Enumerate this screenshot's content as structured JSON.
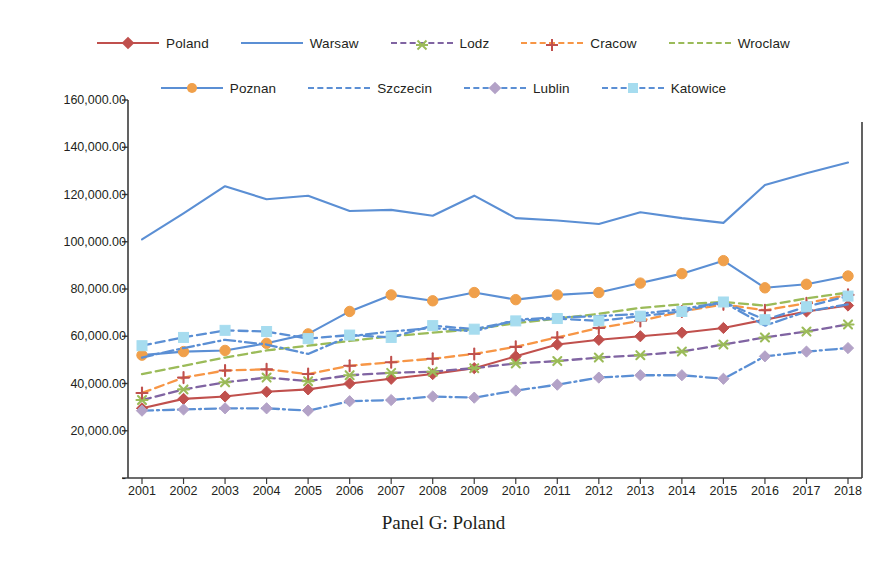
{
  "caption": "Panel G: Poland",
  "chart_data": {
    "type": "line",
    "title": "Panel G: Poland",
    "xlabel": "",
    "ylabel": "",
    "grid": false,
    "legend_position": "top",
    "categories": [
      "2001",
      "2002",
      "2003",
      "2004",
      "2005",
      "2006",
      "2007",
      "2008",
      "2009",
      "2010",
      "2011",
      "2012",
      "2013",
      "2014",
      "2015",
      "2016",
      "2017",
      "2018"
    ],
    "x": [
      2001,
      2002,
      2003,
      2004,
      2005,
      2006,
      2007,
      2008,
      2009,
      2010,
      2011,
      2012,
      2013,
      2014,
      2015,
      2016,
      2017,
      2018
    ],
    "ylim": [
      0,
      160000
    ],
    "ytick_values": [
      0,
      20000,
      40000,
      60000,
      80000,
      100000,
      120000,
      140000,
      160000
    ],
    "ytick_labels": [
      "-",
      "20,000.00",
      "40,000.00",
      "60,000.00",
      "80,000.00",
      "100,000.00",
      "120,000.00",
      "140,000.00",
      "160,000.00"
    ],
    "series": [
      {
        "name": "Poland",
        "color": "#C0504D",
        "marker": "diamond",
        "marker_color": "#C0504D",
        "dash": "solid",
        "values": [
          29500,
          33500,
          34500,
          36500,
          37500,
          40000,
          42000,
          44000,
          46500,
          51500,
          56500,
          58500,
          60000,
          61500,
          63500,
          67000,
          70500,
          73000
        ]
      },
      {
        "name": "Warsaw",
        "color": "#5B8FD4",
        "marker": "none",
        "marker_color": "#5B8FD4",
        "dash": "solid",
        "values": [
          101000,
          112000,
          123500,
          118000,
          119500,
          113000,
          113500,
          111000,
          119500,
          110000,
          109000,
          107500,
          112500,
          110000,
          108000,
          124000,
          129000,
          133500
        ]
      },
      {
        "name": "Lodz",
        "color": "#8064A2",
        "marker": "star",
        "marker_color": "#9BBB59",
        "dash": "dashed",
        "values": [
          33000,
          37500,
          40500,
          42500,
          41000,
          43500,
          44500,
          45000,
          46500,
          48500,
          49500,
          51000,
          52000,
          53500,
          56500,
          59500,
          62000,
          65000
        ]
      },
      {
        "name": "Cracow",
        "color": "#F79646",
        "marker": "plus",
        "marker_color": "#C0504D",
        "dash": "dashed",
        "values": [
          36000,
          42500,
          45500,
          46000,
          44000,
          47500,
          49000,
          50500,
          52500,
          55500,
          59500,
          63500,
          66500,
          70500,
          73500,
          71000,
          74000,
          77500
        ]
      },
      {
        "name": "Wroclaw",
        "color": "#9BBB59",
        "marker": "none",
        "marker_color": "#9BBB59",
        "dash": "dashed",
        "values": [
          44000,
          47500,
          51000,
          54000,
          56000,
          58000,
          60000,
          61500,
          63000,
          65500,
          67500,
          69500,
          72000,
          73500,
          74500,
          73000,
          76000,
          78500
        ]
      },
      {
        "name": "Poznan",
        "color": "#5B8FD4",
        "marker": "circle",
        "marker_color": "#F0A04B",
        "dash": "solid",
        "values": [
          52000,
          53500,
          54000,
          57000,
          61000,
          70500,
          77500,
          75000,
          78500,
          75500,
          77500,
          78500,
          82500,
          86500,
          92000,
          80500,
          82000,
          85500
        ]
      },
      {
        "name": "Szczecin",
        "color": "#5B8FD4",
        "marker": "none",
        "marker_color": "#5B8FD4",
        "dash": "dashdot",
        "values": [
          51000,
          55000,
          58500,
          56500,
          52500,
          60000,
          62000,
          63500,
          62000,
          67000,
          68000,
          68500,
          69500,
          71500,
          74500,
          64500,
          70500,
          73500
        ]
      },
      {
        "name": "Lublin",
        "color": "#5B8FD4",
        "marker": "diamond",
        "marker_color": "#B3A2C7",
        "dash": "dashdot",
        "values": [
          28500,
          29000,
          29500,
          29500,
          28500,
          32500,
          33000,
          34500,
          34000,
          37000,
          39500,
          42500,
          43500,
          43500,
          42000,
          51500,
          53500,
          55000
        ]
      },
      {
        "name": "Katowice",
        "color": "#5B8FD4",
        "marker": "square",
        "marker_color": "#A6DCEF",
        "dash": "dashed",
        "values": [
          56000,
          59500,
          62500,
          62000,
          59000,
          60500,
          59500,
          64500,
          63000,
          66500,
          67500,
          66500,
          68500,
          70500,
          74500,
          67000,
          72500,
          77000
        ]
      }
    ]
  },
  "legend": {
    "row1": [
      "Poland",
      "Warsaw",
      "Lodz",
      "Cracow",
      "Wroclaw"
    ],
    "row2": [
      "Poznan",
      "Szczecin",
      "Lublin",
      "Katowice"
    ]
  }
}
